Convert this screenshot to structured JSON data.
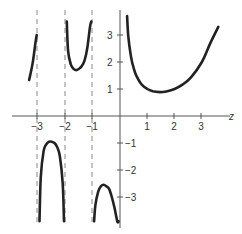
{
  "chart_data": {
    "type": "line",
    "title": "",
    "function": "Gamma function Γ(z)",
    "xlabel": "z",
    "ylabel": "",
    "xlim": [
      -3.5,
      3.8
    ],
    "ylim": [
      -3.9,
      3.8
    ],
    "grid": false,
    "legend": null,
    "x_ticks": [
      -3,
      -2,
      -1,
      1,
      2,
      3
    ],
    "x_tick_labels": [
      "−3",
      "−2",
      "−1",
      "1",
      "2",
      "3"
    ],
    "y_ticks": [
      3,
      2,
      1,
      -1,
      -2,
      -3
    ],
    "y_tick_labels": [
      "3",
      "2",
      "1",
      "−1",
      "−2",
      "−3"
    ],
    "asymptotes": [
      -3,
      -2,
      -1
    ],
    "series": [
      {
        "name": "branch (-4,-3) tail",
        "x": [
          -3.33,
          -3.2,
          -3.1,
          -3.05
        ],
        "y": [
          1.33,
          1.95,
          2.7,
          3.0
        ]
      },
      {
        "name": "branch (-3,-2)",
        "x": [
          -2.95,
          -2.9,
          -2.8,
          -2.7,
          -2.6,
          -2.5,
          -2.4,
          -2.3,
          -2.2,
          -2.1,
          -2.05
        ],
        "y": [
          -3.9,
          -2.25,
          -1.3,
          -1.05,
          -0.95,
          -0.95,
          -1.0,
          -1.15,
          -1.5,
          -2.5,
          -3.9
        ]
      },
      {
        "name": "branch (-2,-1)",
        "x": [
          -1.95,
          -1.9,
          -1.8,
          -1.7,
          -1.6,
          -1.5,
          -1.4,
          -1.3,
          -1.2,
          -1.1,
          -1.05
        ],
        "y": [
          3.5,
          2.4,
          1.9,
          1.75,
          1.7,
          1.75,
          1.85,
          2.05,
          2.5,
          3.3,
          3.5
        ]
      },
      {
        "name": "branch (-1,0)",
        "x": [
          -0.95,
          -0.9,
          -0.8,
          -0.7,
          -0.6,
          -0.5,
          -0.4,
          -0.3,
          -0.2,
          -0.1,
          -0.05
        ],
        "y": [
          -3.9,
          -3.3,
          -2.8,
          -2.6,
          -2.55,
          -2.6,
          -2.7,
          -3.0,
          -3.4,
          -3.9,
          -3.9
        ]
      },
      {
        "name": "branch (0,∞)",
        "x": [
          0.26,
          0.3,
          0.4,
          0.5,
          0.6,
          0.8,
          1.0,
          1.2,
          1.46,
          1.7,
          2.0,
          2.3,
          2.6,
          3.0,
          3.3,
          3.6
        ],
        "y": [
          3.7,
          2.99,
          2.22,
          1.77,
          1.49,
          1.16,
          1.0,
          0.92,
          0.886,
          0.91,
          1.0,
          1.17,
          1.43,
          2.0,
          2.68,
          3.3
        ]
      }
    ]
  },
  "labels": {
    "xlabel": "z",
    "x_ticks": [
      "−3",
      "−2",
      "−1",
      "1",
      "2",
      "3"
    ],
    "y_ticks": [
      "3",
      "2",
      "1",
      "−1",
      "−2",
      "−3"
    ]
  }
}
